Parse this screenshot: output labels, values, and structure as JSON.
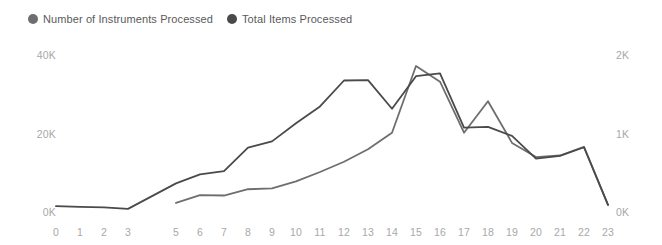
{
  "legend": {
    "position": "top-left",
    "entries": [
      {
        "label": "Number of Instruments Processed",
        "color": "#6e6e6e",
        "icon": "circle-marker-icon"
      },
      {
        "label": "Total Items Processed",
        "color": "#4a4a4a",
        "icon": "circle-marker-icon"
      }
    ]
  },
  "chart_data": {
    "type": "line",
    "title": "",
    "subtitle": "",
    "xlabel": "",
    "ylabel": "",
    "grid": false,
    "legend_position": "top-left",
    "x": [
      0,
      1,
      2,
      3,
      4,
      5,
      6,
      7,
      8,
      9,
      10,
      11,
      12,
      13,
      14,
      15,
      16,
      17,
      18,
      19,
      20,
      21,
      22,
      23
    ],
    "xtick_labels": [
      "0",
      "1",
      "2",
      "3",
      "",
      "5",
      "6",
      "7",
      "8",
      "9",
      "10",
      "11",
      "12",
      "13",
      "14",
      "15",
      "16",
      "17",
      "18",
      "19",
      "20",
      "21",
      "22",
      "23"
    ],
    "axes": [
      {
        "id": "left",
        "side": "left",
        "ylim": [
          0,
          40000
        ],
        "ticks": [
          0,
          20000,
          40000
        ],
        "tick_labels": [
          "0K",
          "20K",
          "40K"
        ]
      },
      {
        "id": "right",
        "side": "right",
        "ylim": [
          0,
          2000
        ],
        "ticks": [
          0,
          1000,
          2000
        ],
        "tick_labels": [
          "0K",
          "1K",
          "2K"
        ]
      }
    ],
    "series": [
      {
        "name": "Number of Instruments Processed",
        "axis": "right",
        "color": "#6e6e6e",
        "width": 1.8,
        "x": [
          5,
          6,
          7,
          8,
          9,
          10,
          11,
          12,
          13,
          14,
          15,
          16,
          17,
          18,
          19,
          20,
          21,
          22,
          23
        ],
        "values": [
          115,
          215,
          210,
          290,
          300,
          390,
          510,
          640,
          800,
          1010,
          1860,
          1660,
          1010,
          1410,
          880,
          700,
          720,
          830,
          90
        ]
      },
      {
        "name": "Total Items Processed",
        "axis": "left",
        "color": "#4a4a4a",
        "width": 1.8,
        "x": [
          0,
          1,
          2,
          3,
          5,
          6,
          7,
          8,
          9,
          10,
          11,
          12,
          13,
          14,
          15,
          16,
          17,
          18,
          19,
          20,
          21,
          22,
          23
        ],
        "values": [
          1500,
          1300,
          1200,
          800,
          7300,
          9600,
          10400,
          16400,
          18000,
          22600,
          26900,
          33500,
          33600,
          26300,
          34600,
          35300,
          21500,
          21700,
          19400,
          13600,
          14300,
          16500,
          1800
        ]
      }
    ]
  }
}
